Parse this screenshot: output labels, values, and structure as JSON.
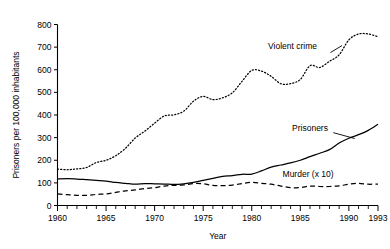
{
  "chart_data": {
    "type": "line",
    "title": "",
    "xlabel": "Year",
    "ylabel": "Prisoners per 100,000 inhabitants",
    "xlim": [
      1960,
      1993
    ],
    "ylim": [
      0,
      800
    ],
    "ytick_values": [
      0,
      100,
      200,
      300,
      400,
      500,
      600,
      700,
      800
    ],
    "ytick_labels": [
      "0",
      "100",
      "200",
      "300",
      "400",
      "500",
      "600",
      "700",
      "800"
    ],
    "xtick_labels": [
      "1960",
      "1965",
      "1970",
      "1975",
      "1980",
      "1985",
      "1990",
      "1993"
    ],
    "xtick_label_values": [
      1960,
      1965,
      1970,
      1975,
      1980,
      1985,
      1990,
      1993
    ],
    "xtick_minor_step": 1,
    "grid": false,
    "legend_position": "inline-annotations",
    "x": [
      1960,
      1961,
      1962,
      1963,
      1964,
      1965,
      1966,
      1967,
      1968,
      1969,
      1970,
      1971,
      1972,
      1973,
      1974,
      1975,
      1976,
      1977,
      1978,
      1979,
      1980,
      1981,
      1982,
      1983,
      1984,
      1985,
      1986,
      1987,
      1988,
      1989,
      1990,
      1991,
      1992,
      1993
    ],
    "series": [
      {
        "name": "Violent crime",
        "style": "dotted",
        "label": "Violent crime",
        "label_x": 1984.2,
        "label_y": 690,
        "values": [
          161,
          158,
          162,
          168,
          190,
          200,
          220,
          253,
          298,
          329,
          364,
          396,
          401,
          417,
          461,
          482,
          468,
          476,
          498,
          549,
          597,
          594,
          571,
          538,
          539,
          557,
          618,
          610,
          637,
          666,
          732,
          758,
          758,
          746
        ]
      },
      {
        "name": "Prisoners",
        "style": "solid",
        "label": "Prisoners",
        "label_x": 1986.0,
        "label_y": 330,
        "values": [
          117,
          119,
          117,
          114,
          111,
          108,
          102,
          98,
          94,
          97,
          96,
          95,
          93,
          96,
          102,
          111,
          120,
          129,
          132,
          138,
          139,
          153,
          170,
          179,
          188,
          200,
          216,
          231,
          247,
          276,
          297,
          313,
          332,
          359
        ]
      },
      {
        "name": "Murder (x 10)",
        "style": "dashed",
        "label": "Murder (x 10)",
        "label_x": 1985.8,
        "label_y": 128,
        "values": [
          51,
          48,
          45,
          45,
          49,
          51,
          58,
          65,
          69,
          75,
          79,
          86,
          89,
          91,
          97,
          96,
          89,
          88,
          90,
          97,
          102,
          98,
          94,
          86,
          79,
          79,
          86,
          84,
          84,
          87,
          94,
          98,
          94,
          95
        ]
      }
    ]
  }
}
